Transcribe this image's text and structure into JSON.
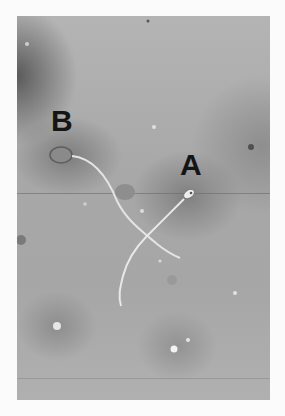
{
  "image": {
    "description": "Grayscale micrograph of two sperm cells with crossing tails",
    "labels": [
      {
        "id": "A",
        "text": "A"
      },
      {
        "id": "B",
        "text": "B"
      }
    ],
    "colors": {
      "background": "#fbfbfb",
      "field": "#a8a8a8",
      "label": "#151515",
      "tail": "#e6e6e6"
    }
  }
}
